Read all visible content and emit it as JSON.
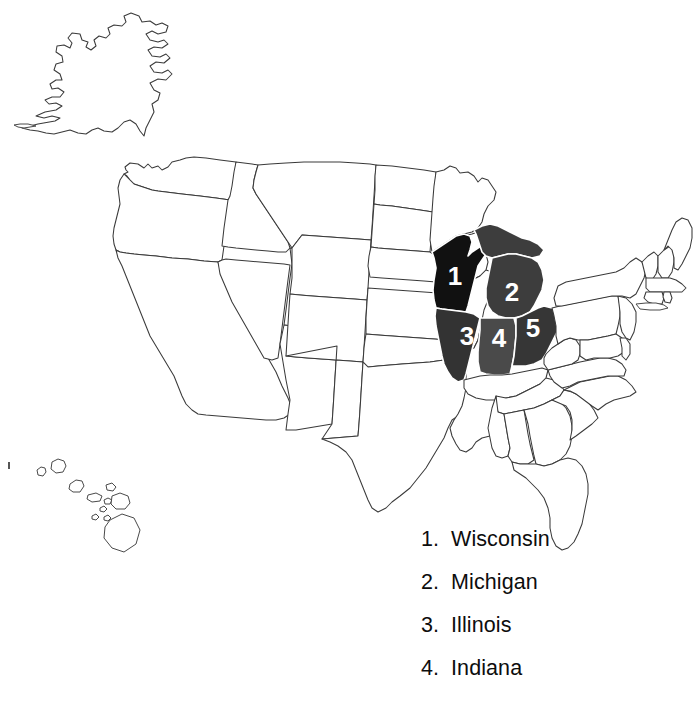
{
  "document": {
    "type": "us-map-worksheet",
    "title": "United States Map with Numbered Great Lakes States",
    "background_color": "#ffffff",
    "outline_color": "#3a3a3a"
  },
  "map": {
    "name": "united-states-map",
    "includes_alaska": true,
    "includes_hawaii": true,
    "highlighted_states": [
      {
        "number": "1",
        "name": "Wisconsin",
        "fill": "#111111",
        "label_x": 455,
        "label_y": 278
      },
      {
        "number": "2",
        "name": "Michigan",
        "fill": "#3d3d3d",
        "label_x": 512,
        "label_y": 294
      },
      {
        "number": "3",
        "name": "Illinois",
        "fill": "#333333",
        "label_x": 467,
        "label_y": 338
      },
      {
        "number": "4",
        "name": "Indiana",
        "fill": "#4a4a4a",
        "label_x": 499,
        "label_y": 340
      },
      {
        "number": "5",
        "name": "Ohio",
        "fill": "#363636",
        "label_x": 533,
        "label_y": 330
      }
    ],
    "number_text_color": "#ffffff"
  },
  "legend": {
    "name": "state-legend",
    "items": [
      {
        "number": "1.",
        "label": "Wisconsin"
      },
      {
        "number": "2.",
        "label": "Michigan"
      },
      {
        "number": "3.",
        "label": "Illinois"
      },
      {
        "number": "4.",
        "label": "Indiana"
      }
    ]
  }
}
